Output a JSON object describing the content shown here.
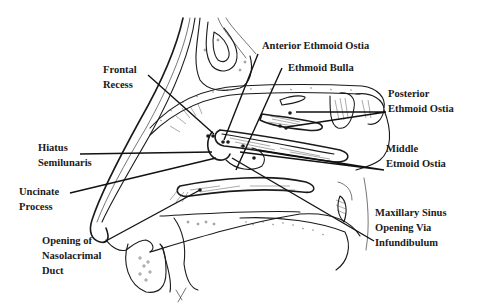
{
  "figure": {
    "background": "#ffffff",
    "ink": "#1a1a1a"
  },
  "labels": {
    "anterior_ethmoid_ostia": {
      "lines": [
        "Anterior Ethmoid Ostia"
      ]
    },
    "ethmoid_bulla": {
      "lines": [
        "Ethmoid Bulla"
      ]
    },
    "frontal_recess": {
      "lines": [
        "Frontal",
        "Recess"
      ]
    },
    "posterior_ethmoid_ostia": {
      "lines": [
        "Posterior",
        "Ethmoid Ostia"
      ]
    },
    "hiatus_semilunaris": {
      "lines": [
        "Hiatus",
        "Semilunaris"
      ]
    },
    "middle_ethmoid_ostia": {
      "lines": [
        "Middle",
        "Etmoid Ostia"
      ]
    },
    "uncinate_process": {
      "lines": [
        "Uncinate",
        "Process"
      ]
    },
    "maxillary_sinus_opening": {
      "lines": [
        "Maxillary Sinus",
        "Opening Via",
        "Infundibulum"
      ]
    },
    "nasolacrimal_duct": {
      "lines": [
        "Opening of",
        "Nasolacrimal",
        "Duct"
      ]
    }
  }
}
